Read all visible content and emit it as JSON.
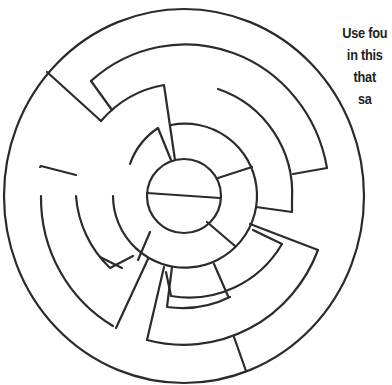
{
  "puzzle": {
    "type": "circular-maze",
    "center": [
      184,
      196
    ],
    "ring_radii": [
      37,
      72,
      108,
      144,
      181
    ],
    "stroke_color": "#2b2b2b",
    "background_color": "#ffffff"
  },
  "instructions": {
    "lines": [
      "Use fou",
      "in this",
      "that",
      "sa"
    ]
  }
}
